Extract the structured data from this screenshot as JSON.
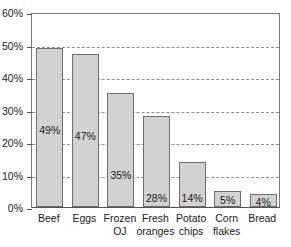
{
  "chart_data": {
    "type": "bar",
    "title": "",
    "subtitle": "",
    "xlabel": "",
    "ylabel": "",
    "categories": [
      "Beef",
      "Eggs",
      "Frozen OJ",
      "Fresh oranges",
      "Potato chips",
      "Corn flakes",
      "Bread"
    ],
    "category_lines": [
      [
        "Beef",
        ""
      ],
      [
        "Eggs",
        ""
      ],
      [
        "Frozen",
        "OJ"
      ],
      [
        "Fresh",
        "oranges"
      ],
      [
        "Potato",
        "chips"
      ],
      [
        "Corn",
        "flakes"
      ],
      [
        "Bread",
        ""
      ]
    ],
    "values": [
      49,
      47,
      35,
      28,
      14,
      5,
      4
    ],
    "value_labels": [
      "49%",
      "47%",
      "35%",
      "28%",
      "14%",
      "5%",
      "4%"
    ],
    "ylim": [
      0,
      60
    ],
    "ytick_values": [
      0,
      10,
      20,
      30,
      40,
      50,
      60
    ],
    "ytick_labels": [
      "0%",
      "10%",
      "20%",
      "30%",
      "40%",
      "50%",
      "60%"
    ],
    "grid": "horizontal-dashed",
    "legend": "none",
    "bar_fill_color": "#d2d2d2",
    "bar_edge_color": "#6e6e6e",
    "grid_color": "#8c8c8c",
    "axis_color": "#555555",
    "background_color": "#ffffff"
  }
}
